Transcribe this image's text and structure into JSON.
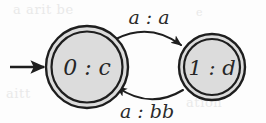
{
  "figure": {
    "kind": "finite-state-transducer-diagram",
    "background_color": "#fdfdfd",
    "ink_color": "#1e1e1e",
    "state_fill_color": "#dcdcdc"
  },
  "states": [
    {
      "id": "0",
      "label": "0 : c",
      "input_symbol": "0",
      "separator": ":",
      "output_symbol": "c",
      "accepting": true,
      "initial": true,
      "cx": 87,
      "cy": 67,
      "r_outer": 41,
      "r_inner": 36
    },
    {
      "id": "1",
      "label": "1 : d",
      "input_symbol": "1",
      "separator": ":",
      "output_symbol": "d",
      "accepting": true,
      "initial": false,
      "cx": 212,
      "cy": 67,
      "r_outer": 33,
      "r_inner": 28
    }
  ],
  "transitions": [
    {
      "from": "0",
      "to": "1",
      "label": "a : a",
      "input": "a",
      "output": "a",
      "position": "top",
      "label_x": 149,
      "label_y": 18
    },
    {
      "from": "1",
      "to": "0",
      "label": "a : bb",
      "input": "a",
      "output": "bb",
      "position": "bottom",
      "label_x": 147,
      "label_y": 110
    }
  ],
  "start_arrow": {
    "label": "",
    "x_start": 10,
    "x_end": 46,
    "y": 67
  },
  "ghost_artifacts": {
    "top_left": "a arit be",
    "top_right": "e",
    "bottom_left": "aitt",
    "bottom_right": "ation"
  }
}
